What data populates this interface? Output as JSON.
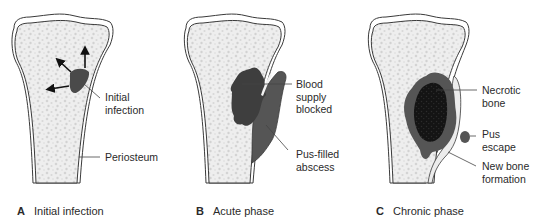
{
  "colors": {
    "bone_fill": "#ededed",
    "outline": "#3a3a3a",
    "infection": "#4a4a4a",
    "abscess": "#555555",
    "necrotic": "#151515",
    "leader": "#444444"
  },
  "panels": [
    {
      "letter": "A",
      "caption": "Initial infection",
      "labels": [
        {
          "text": "Initial\ninfection"
        },
        {
          "text": "Periosteum"
        }
      ]
    },
    {
      "letter": "B",
      "caption": "Acute phase",
      "labels": [
        {
          "text": "Blood\nsupply\nblocked"
        },
        {
          "text": "Pus-filled\nabscess"
        }
      ]
    },
    {
      "letter": "C",
      "caption": "Chronic phase",
      "labels": [
        {
          "text": "Necrotic\nbone"
        },
        {
          "text": "Pus\nescape"
        },
        {
          "text": "New bone\nformation"
        }
      ]
    }
  ]
}
